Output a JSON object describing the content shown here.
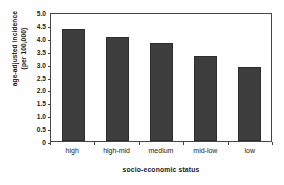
{
  "chart_data": {
    "type": "bar",
    "title": "socio-economic status",
    "title_cropped": true,
    "categories": [
      "high",
      "high-mid",
      "medium",
      "mid-low",
      "low"
    ],
    "values": [
      4.35,
      4.05,
      3.78,
      3.28,
      2.88
    ],
    "series": [
      {
        "name": "age-adjusted incidence",
        "values": [
          4.35,
          4.05,
          3.78,
          3.28,
          2.88
        ]
      }
    ],
    "xlabel": "socio-economic status",
    "ylabel_line1": "age-adjusted incidence",
    "ylabel_line2": "(per 100,000)",
    "ylim": [
      0,
      5.0
    ],
    "yticks": [
      "5.0",
      "4.5",
      "4.0",
      "3.5",
      "3.0",
      "2.5",
      "2.0",
      "1.5",
      "1.0",
      "0.5",
      "0"
    ],
    "ytick_values": [
      5.0,
      4.5,
      4.0,
      3.5,
      3.0,
      2.5,
      2.0,
      1.5,
      1.0,
      0.5,
      0
    ],
    "grid": false,
    "legend": null,
    "legend_position": "none",
    "bar_color": "#3d3d3d",
    "frame_color": "#454545",
    "plot_background": "#ffffff"
  }
}
